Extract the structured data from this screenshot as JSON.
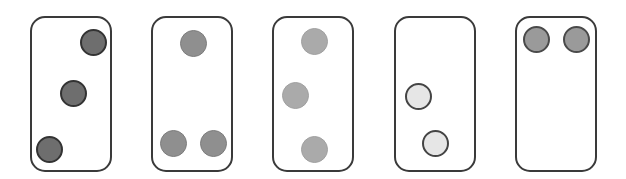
{
  "diagram": {
    "title": "",
    "card_size": {
      "width": 82,
      "height": 156
    },
    "card_top": 16,
    "dot_diameter": 27,
    "styles": {
      "dark": {
        "fill": "#6e6e6e",
        "border": "#333333",
        "border_width": 2.5
      },
      "medium": {
        "fill": "#8f8f8f",
        "border": "#7c7c7c",
        "border_width": 1
      },
      "light": {
        "fill": "#aaaaaa",
        "border": "#a0a0a0",
        "border_width": 1
      },
      "pale": {
        "fill": "#e6e6e6",
        "border": "#444444",
        "border_width": 2.5
      },
      "gray": {
        "fill": "#9a9a9a",
        "border": "#4a4a4a",
        "border_width": 2.5
      }
    },
    "cards": [
      {
        "id": "card-1",
        "left": 30,
        "dot_style": "dark",
        "dot_count": 3,
        "dots": [
          {
            "cx": 93,
            "cy": 42
          },
          {
            "cx": 73,
            "cy": 93
          },
          {
            "cx": 49,
            "cy": 149
          }
        ]
      },
      {
        "id": "card-2",
        "left": 151,
        "dot_style": "medium",
        "dot_count": 3,
        "dots": [
          {
            "cx": 193,
            "cy": 43
          },
          {
            "cx": 173,
            "cy": 143
          },
          {
            "cx": 213,
            "cy": 143
          }
        ]
      },
      {
        "id": "card-3",
        "left": 272,
        "dot_style": "light",
        "dot_count": 3,
        "dots": [
          {
            "cx": 314,
            "cy": 41
          },
          {
            "cx": 295,
            "cy": 95
          },
          {
            "cx": 314,
            "cy": 149
          }
        ]
      },
      {
        "id": "card-4",
        "left": 394,
        "dot_style": "pale",
        "dot_count": 2,
        "dots": [
          {
            "cx": 418,
            "cy": 96
          },
          {
            "cx": 435,
            "cy": 143
          }
        ]
      },
      {
        "id": "card-5",
        "left": 515,
        "dot_style": "gray",
        "dot_count": 2,
        "dots": [
          {
            "cx": 536,
            "cy": 39
          },
          {
            "cx": 576,
            "cy": 39
          }
        ]
      }
    ]
  }
}
